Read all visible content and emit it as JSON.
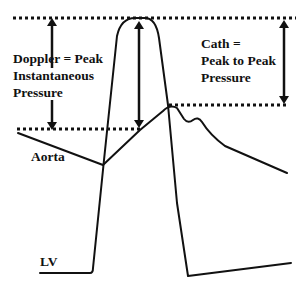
{
  "diagram": {
    "type": "pressure-waveform-comparison",
    "labels": {
      "doppler_line1": "Doppler = Peak",
      "doppler_line2": "Instantaneous",
      "doppler_line3": "Pressure",
      "cath_line1": "Cath =",
      "cath_line2": "Peak to Peak",
      "cath_line3": "Pressure",
      "aorta": "Aorta",
      "lv": "LV"
    },
    "traces": [
      "LV",
      "Aorta"
    ],
    "reference_lines": [
      "LV peak",
      "Aorta peak",
      "Doppler lower level"
    ],
    "colors": {
      "ink": "#111111",
      "background": "#ffffff"
    }
  }
}
